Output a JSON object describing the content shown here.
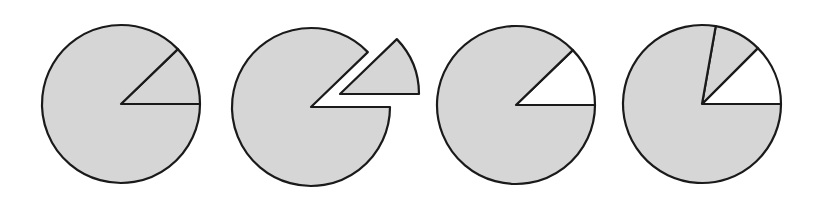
{
  "figure": {
    "name": "pie-fraction-series",
    "background_color": "#ffffff",
    "width": 827,
    "height": 202,
    "caption": "",
    "title": ""
  },
  "style": {
    "fill_color": "#d6d6d6",
    "empty_color": "#ffffff",
    "stroke_color": "#1a1a1a",
    "stroke_width": 2.2,
    "radius": 79
  },
  "chart_data": {
    "type": "pie",
    "title": "",
    "subtitle": "",
    "xlabel": "",
    "ylabel": "",
    "legend": [],
    "grid": false,
    "note": "Four circle (pie) diagrams illustrating the same wedge fraction shown four ways: shaded whole with wedge outlined, exploded wedge, wedge removed, and wedge subdivided.",
    "charts": [
      {
        "index": 1,
        "name": "pie-1-wedge-outlined",
        "center_x": 121,
        "center_y": 104,
        "radius": 79,
        "exploded": false,
        "description": "Full shaded circle with a wedge outlined in place",
        "slices": [
          {
            "label": "wedge",
            "start_angle": 0,
            "end_angle": 44,
            "fraction": 0.122,
            "value": 44,
            "filled": true,
            "exploded": false
          },
          {
            "label": "remainder",
            "start_angle": 44,
            "end_angle": 360,
            "fraction": 0.878,
            "value": 316,
            "filled": true,
            "exploded": false
          }
        ]
      },
      {
        "index": 2,
        "name": "pie-2-wedge-exploded",
        "center_x": 311,
        "center_y": 107,
        "radius": 79,
        "exploded": true,
        "explode_offset_x": 29,
        "explode_offset_y": -13,
        "description": "Circle with the wedge detached and pulled outward",
        "slices": [
          {
            "label": "wedge",
            "start_angle": 0,
            "end_angle": 44,
            "fraction": 0.122,
            "value": 44,
            "filled": true,
            "exploded": true
          },
          {
            "label": "remainder",
            "start_angle": 44,
            "end_angle": 360,
            "fraction": 0.878,
            "value": 316,
            "filled": true,
            "exploded": false
          }
        ]
      },
      {
        "index": 3,
        "name": "pie-3-wedge-removed",
        "center_x": 516,
        "center_y": 105,
        "radius": 79,
        "exploded": false,
        "description": "Circle with the wedge left unshaded (removed)",
        "slices": [
          {
            "label": "wedge",
            "start_angle": 0,
            "end_angle": 44,
            "fraction": 0.122,
            "value": 44,
            "filled": false,
            "exploded": false
          },
          {
            "label": "remainder",
            "start_angle": 44,
            "end_angle": 360,
            "fraction": 0.878,
            "value": 316,
            "filled": true,
            "exploded": false
          }
        ]
      },
      {
        "index": 4,
        "name": "pie-4-wedge-subdivided",
        "center_x": 702,
        "center_y": 104,
        "radius": 79,
        "exploded": false,
        "description": "Circle with an unshaded wedge and an adjacent shaded wedge",
        "slices": [
          {
            "label": "wedge-empty",
            "start_angle": 0,
            "end_angle": 45,
            "fraction": 0.125,
            "value": 45,
            "filled": false,
            "exploded": false
          },
          {
            "label": "wedge-shaded",
            "start_angle": 45,
            "end_angle": 80,
            "fraction": 0.097,
            "value": 35,
            "filled": true,
            "exploded": false
          },
          {
            "label": "remainder",
            "start_angle": 80,
            "end_angle": 360,
            "fraction": 0.778,
            "value": 280,
            "filled": true,
            "exploded": false
          }
        ]
      }
    ]
  }
}
